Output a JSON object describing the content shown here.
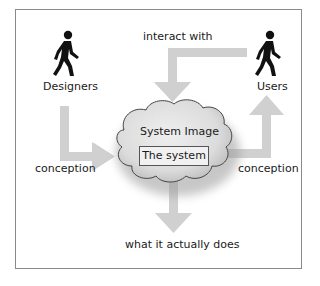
{
  "diagram": {
    "actors": {
      "designers": {
        "label": "Designers",
        "icon": "walking-person-icon"
      },
      "users": {
        "label": "Users",
        "icon": "walking-person-icon"
      }
    },
    "cloud_label": "System Image",
    "system_box_label": "The system",
    "arrows": {
      "designers_to_system": "conception",
      "users_to_system": "interact with",
      "system_to_users": "conception",
      "system_output": "what it actually does"
    },
    "colors": {
      "arrow": "#d0d0d0",
      "cloud_fill": "#e4e4e4",
      "frame_border": "#8a8a8a"
    }
  }
}
